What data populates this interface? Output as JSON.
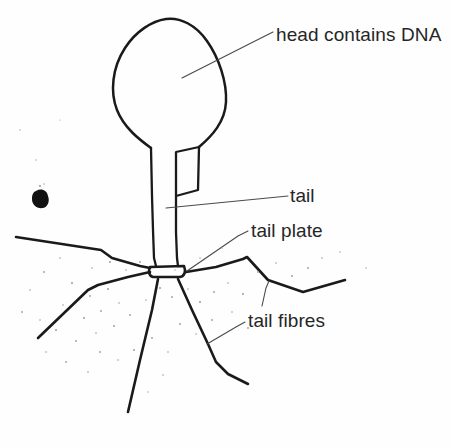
{
  "figure": {
    "style": "hand-drawn line illustration, scanned black ink on white paper",
    "background_color": "#fefefe",
    "ink_color": "#1a1a1a",
    "leader_line_color": "#4a4a4a",
    "text_color": "#262626"
  },
  "labels": {
    "head": "head contains DNA",
    "tail": "tail",
    "tail_plate": "tail plate",
    "tail_fibres": "tail fibres"
  },
  "caption": {
    "text": ""
  },
  "structures": {
    "head": "teardrop-shaped capsid",
    "tail": "narrow vertical tube",
    "tail_plate": "small horizontal baseplate bar",
    "tail_fibres": "six radiating kinked fibres"
  },
  "artifacts": {
    "ink_blot": "dark ink smudge at left",
    "stipple": "scattered grey speckles below baseplate"
  }
}
